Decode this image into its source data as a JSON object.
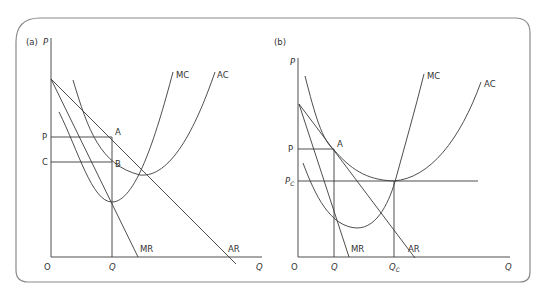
{
  "panel_a": {
    "tag": "(a)",
    "y_axis_label": "P",
    "x_axis_label": "Q",
    "origin_label": "O",
    "price_label": "P",
    "cost_label": "C",
    "quantity_label": "Q",
    "point_a": "A",
    "point_b": "B",
    "curves": {
      "mc": "MC",
      "ac": "AC",
      "mr": "MR",
      "ar": "AR"
    }
  },
  "panel_b": {
    "tag": "(b)",
    "y_axis_label": "P",
    "x_axis_label": "Q",
    "origin_label": "O",
    "price_label": "P",
    "competitive_price_label": "P",
    "competitive_price_sub": "C",
    "quantity_label": "Q",
    "competitive_quantity_label": "Q",
    "competitive_quantity_sub": "C",
    "point_a": "A",
    "curves": {
      "mc": "MC",
      "ac": "AC",
      "mr": "MR",
      "ar": "AR"
    }
  },
  "colors": {
    "line": "#3a3a3a",
    "frame": "#8a8a8a",
    "background": "#ffffff"
  }
}
